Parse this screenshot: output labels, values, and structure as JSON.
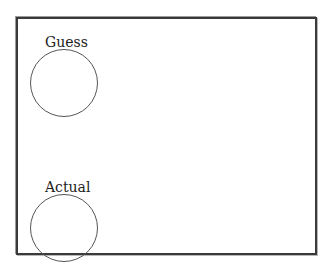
{
  "guess": {
    "label": "Guess"
  },
  "actual": {
    "label": "Actual"
  }
}
